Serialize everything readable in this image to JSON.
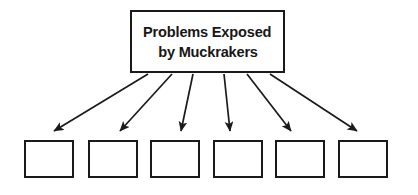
{
  "diagram": {
    "type": "fan-out-flowchart",
    "background_color": "#ffffff",
    "stroke_color": "#1a1a1a",
    "text_color": "#171717",
    "title_box": {
      "name": "Problems Exposed by Muckrakers",
      "line1": "Problems Exposed",
      "line2": "by Muckrakers",
      "x": 130,
      "y": 10,
      "width": 155,
      "height": 63
    },
    "arrow_count": 6,
    "arrows": [
      {
        "x1": 148,
        "y1": 74,
        "x2": 54,
        "y2": 131
      },
      {
        "x1": 172,
        "y1": 74,
        "x2": 120,
        "y2": 131
      },
      {
        "x1": 193,
        "y1": 74,
        "x2": 181,
        "y2": 131
      },
      {
        "x1": 224,
        "y1": 74,
        "x2": 230,
        "y2": 131
      },
      {
        "x1": 247,
        "y1": 74,
        "x2": 291,
        "y2": 131
      },
      {
        "x1": 270,
        "y1": 74,
        "x2": 357,
        "y2": 131
      }
    ],
    "leaf_boxes": [
      {
        "label": "",
        "x": 24,
        "y": 140,
        "width": 50,
        "height": 38
      },
      {
        "label": "",
        "x": 88,
        "y": 140,
        "width": 50,
        "height": 38
      },
      {
        "label": "",
        "x": 150,
        "y": 140,
        "width": 50,
        "height": 38
      },
      {
        "label": "",
        "x": 213,
        "y": 140,
        "width": 50,
        "height": 38
      },
      {
        "label": "",
        "x": 275,
        "y": 140,
        "width": 50,
        "height": 38
      },
      {
        "label": "",
        "x": 338,
        "y": 140,
        "width": 50,
        "height": 38
      }
    ]
  }
}
